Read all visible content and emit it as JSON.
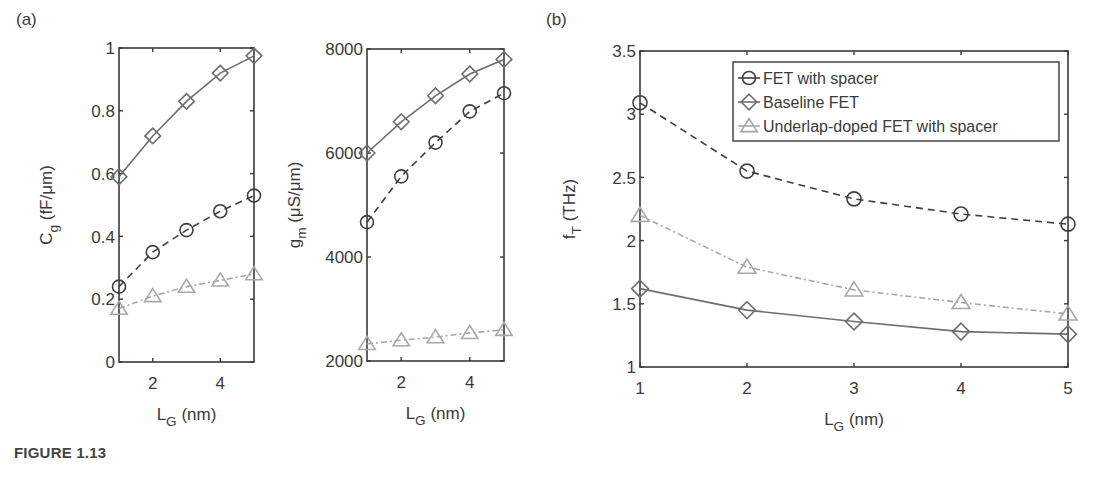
{
  "figure": {
    "caption": "FIGURE 1.13",
    "panel_labels": [
      "(a)",
      "(b)"
    ]
  },
  "colors": {
    "axis": "#3a3a3a",
    "fet_with_spacer": "#3f3f3f",
    "baseline_fet": "#6e6e6e",
    "underlap_doped": "#a8a8a8"
  },
  "legend": {
    "items": [
      {
        "label": "FET with spacer",
        "marker": "circle",
        "line": "dashed"
      },
      {
        "label": "Baseline FET",
        "marker": "diamond",
        "line": "solid"
      },
      {
        "label": "Underlap-doped FET with spacer",
        "marker": "triangle",
        "line": "dashdot"
      }
    ]
  },
  "chart_data": [
    {
      "id": "a-left",
      "panel": "(a)",
      "type": "line",
      "title": "",
      "xlabel": "L_G (nm)",
      "ylabel": "C_g (fF/μm)",
      "x": [
        1,
        2,
        3,
        4,
        5
      ],
      "xlim": [
        1,
        5
      ],
      "ylim": [
        0,
        1
      ],
      "xticks": [
        2,
        4
      ],
      "yticks": [
        0,
        0.2,
        0.4,
        0.6,
        0.8,
        1
      ],
      "ytick_labels": [
        "0",
        "0.2",
        "0.4",
        "0.6",
        "0.8",
        "1"
      ],
      "grid": false,
      "series": [
        {
          "name": "FET with spacer",
          "values": [
            0.24,
            0.35,
            0.42,
            0.48,
            0.53
          ]
        },
        {
          "name": "Baseline FET",
          "values": [
            0.59,
            0.72,
            0.83,
            0.92,
            0.975
          ]
        },
        {
          "name": "Underlap-doped FET with spacer",
          "values": [
            0.17,
            0.21,
            0.24,
            0.26,
            0.28
          ]
        }
      ]
    },
    {
      "id": "a-right",
      "panel": "(a)",
      "type": "line",
      "title": "",
      "xlabel": "L_G (nm)",
      "ylabel": "g_m (μS/μm)",
      "x": [
        1,
        2,
        3,
        4,
        5
      ],
      "xlim": [
        1,
        5
      ],
      "ylim": [
        2000,
        8000
      ],
      "xticks": [
        2,
        4
      ],
      "yticks": [
        2000,
        4000,
        6000,
        8000
      ],
      "ytick_labels": [
        "2000",
        "4000",
        "6000",
        "8000"
      ],
      "grid": false,
      "series": [
        {
          "name": "FET with spacer",
          "values": [
            4670,
            5550,
            6200,
            6800,
            7150
          ]
        },
        {
          "name": "Baseline FET",
          "values": [
            6000,
            6600,
            7100,
            7520,
            7800
          ]
        },
        {
          "name": "Underlap-doped FET with spacer",
          "values": [
            2330,
            2400,
            2460,
            2540,
            2600
          ]
        }
      ]
    },
    {
      "id": "b",
      "panel": "(b)",
      "type": "line",
      "title": "",
      "xlabel": "L_G (nm)",
      "ylabel": "f_T (THz)",
      "x": [
        1,
        2,
        3,
        4,
        5
      ],
      "xlim": [
        1,
        5
      ],
      "ylim": [
        1,
        3.5
      ],
      "xticks": [
        1,
        2,
        3,
        4,
        5
      ],
      "yticks": [
        1,
        1.5,
        2,
        2.5,
        3,
        3.5
      ],
      "ytick_labels": [
        "1",
        "1.5",
        "2",
        "2.5",
        "3",
        "3.5"
      ],
      "grid": false,
      "legend_position": "upper right",
      "series": [
        {
          "name": "FET with spacer",
          "values": [
            3.09,
            2.55,
            2.33,
            2.21,
            2.13
          ]
        },
        {
          "name": "Baseline FET",
          "values": [
            1.62,
            1.45,
            1.36,
            1.28,
            1.26
          ]
        },
        {
          "name": "Underlap-doped FET with spacer",
          "values": [
            2.2,
            1.79,
            1.61,
            1.51,
            1.42
          ]
        }
      ]
    }
  ]
}
